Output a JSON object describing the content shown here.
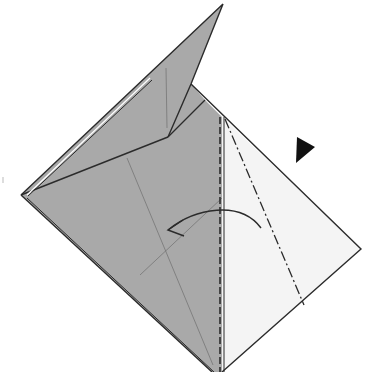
{
  "diagram": {
    "type": "origami-step",
    "colors": {
      "background": "#ffffff",
      "paper_colored": "#a9a9a9",
      "paper_white": "#f4f4f4",
      "line": "#2b2b2b",
      "thin_line": "#6e6e6e",
      "marker": "#111111"
    },
    "elements": {
      "valley_fold_line": "dashed vertical fold line",
      "mountain_fold_line": "dash-dot fold line",
      "fold_arrow": "curved arrow pointing left",
      "push_marker": "black triangle pointing right-down"
    }
  }
}
